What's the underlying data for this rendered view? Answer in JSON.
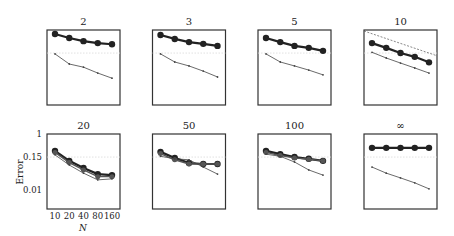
{
  "chart_data": {
    "type": "line",
    "layout": "small multiples 2x4",
    "ylabel": "Error",
    "xlabel": "N",
    "yscale": "log",
    "ylim": [
      0.0023,
      1
    ],
    "yticks": [
      1,
      0.15,
      0.01
    ],
    "ytick_labels": [
      "1",
      "0.15",
      "0.01"
    ],
    "x": [
      10,
      20,
      40,
      80,
      160
    ],
    "xtick_labels": [
      "10",
      "20",
      "40",
      "80",
      "160"
    ],
    "reference_line": 0.15,
    "panels": [
      {
        "title": "2",
        "series": [
          {
            "name": "thick",
            "values": [
              0.72,
              0.52,
              0.4,
              0.34,
              0.31
            ]
          },
          {
            "name": "thin",
            "values": [
              0.14,
              0.061,
              0.047,
              0.029,
              0.019
            ]
          }
        ]
      },
      {
        "title": "3",
        "series": [
          {
            "name": "thick",
            "values": [
              0.66,
              0.48,
              0.37,
              0.32,
              0.27
            ]
          },
          {
            "name": "thin",
            "values": [
              0.14,
              0.072,
              0.052,
              0.034,
              0.021
            ]
          }
        ]
      },
      {
        "title": "5",
        "series": [
          {
            "name": "thick",
            "values": [
              0.52,
              0.37,
              0.27,
              0.23,
              0.18
            ]
          },
          {
            "name": "thin",
            "values": [
              0.14,
              0.072,
              0.052,
              0.037,
              0.025
            ]
          }
        ]
      },
      {
        "title": "10",
        "dashed_line": [
          0.92,
          0.12
        ],
        "series": [
          {
            "name": "thick",
            "values": [
              0.34,
              0.23,
              0.15,
              0.11,
              0.07
            ]
          },
          {
            "name": "thin",
            "values": [
              0.16,
              0.1,
              0.066,
              0.044,
              0.029
            ]
          }
        ]
      },
      {
        "title": "20",
        "series": [
          {
            "name": "thick",
            "values": [
              0.25,
              0.11,
              0.061,
              0.037,
              0.034
            ]
          },
          {
            "name": "thick2",
            "values": [
              0.22,
              0.095,
              0.052,
              0.03,
              0.03
            ]
          },
          {
            "name": "thin",
            "values": [
              0.18,
              0.078,
              0.04,
              0.023,
              0.025
            ]
          }
        ]
      },
      {
        "title": "50",
        "series": [
          {
            "name": "thick",
            "values": [
              0.23,
              0.14,
              0.092,
              0.085,
              0.085
            ]
          },
          {
            "name": "thick2",
            "values": [
              0.2,
              0.12,
              0.085,
              0.085,
              0.085
            ]
          },
          {
            "name": "thin",
            "values": [
              0.16,
              0.13,
              0.12,
              0.066,
              0.037
            ]
          }
        ]
      },
      {
        "title": "100",
        "series": [
          {
            "name": "thick",
            "values": [
              0.25,
              0.19,
              0.15,
              0.13,
              0.11
            ]
          },
          {
            "name": "thick2",
            "values": [
              0.22,
              0.17,
              0.14,
              0.125,
              0.11
            ]
          },
          {
            "name": "thin",
            "values": [
              0.19,
              0.16,
              0.1,
              0.052,
              0.034
            ]
          }
        ]
      },
      {
        "title": "∞",
        "series": [
          {
            "name": "thick",
            "values": [
              0.32,
              0.32,
              0.32,
              0.32,
              0.32
            ]
          },
          {
            "name": "thin",
            "values": [
              0.066,
              0.04,
              0.027,
              0.018,
              0.011
            ]
          }
        ]
      }
    ]
  },
  "colors": {
    "axis": "#333333",
    "thick_line": "#222222",
    "thick_line_alt": "#555555",
    "thin_line": "#444444",
    "reference_line": "#d8d8d8"
  }
}
